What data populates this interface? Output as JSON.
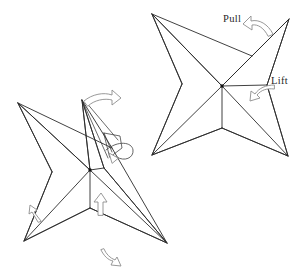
{
  "figure": {
    "type": "line-drawing",
    "background_color": "#ffffff",
    "line_color": "#2b2b2b",
    "arrow_outline_color": "#8d8d8d",
    "arrow_fill_color": "#ffffff",
    "text_color": "#1f1f1f"
  },
  "labels": {
    "pull": "Pull",
    "lift": "Lift"
  },
  "panels": [
    {
      "id": "right-star",
      "name": "four-point-star-before",
      "description": "Four pointed star / blintz base shown before the fold",
      "center_hub": [
        222,
        86
      ],
      "tips": [
        {
          "name": "top-left-tip",
          "x": 152,
          "y": 14
        },
        {
          "name": "top-right-tip",
          "x": 289,
          "y": 19
        },
        {
          "name": "bottom-left-tip",
          "x": 152,
          "y": 155
        },
        {
          "name": "bottom-right-tip",
          "x": 288,
          "y": 156
        }
      ],
      "inner_vertices": [
        {
          "name": "lower-inner-vertex",
          "x": 222,
          "y": 128
        },
        {
          "name": "right-inner-vertex",
          "x": 267,
          "y": 85
        }
      ]
    },
    {
      "id": "left-star",
      "name": "four-point-star-after",
      "description": "Same star after the flap has been pulled and lifted into a pinched point",
      "center_hub": [
        90,
        170
      ],
      "tips": [
        {
          "name": "left-tip",
          "x": 18,
          "y": 103
        },
        {
          "name": "top-pinch-tip",
          "x": 82,
          "y": 100
        },
        {
          "name": "bottom-left-tip",
          "x": 24,
          "y": 241
        },
        {
          "name": "bottom-right-tip",
          "x": 167,
          "y": 243
        }
      ],
      "inner_vertices": [
        {
          "name": "lower-inner-vertex",
          "x": 90,
          "y": 208
        },
        {
          "name": "right-inner-vertex",
          "x": 104,
          "y": 168
        }
      ]
    }
  ],
  "arrows": [
    {
      "name": "pull-arrow",
      "points_toward": "up-left",
      "near_label": "Pull",
      "x": 258,
      "y": 26
    },
    {
      "name": "lift-arrow",
      "points_toward": "left",
      "near_label": "Lift",
      "x": 257,
      "y": 92
    },
    {
      "name": "open-arrow-top-left-star",
      "points_toward": "right",
      "x": 97,
      "y": 97
    },
    {
      "name": "flap-hook-arrow",
      "points_toward": "curl-under",
      "x": 115,
      "y": 140
    },
    {
      "name": "lower-left-arrow",
      "points_toward": "up-left",
      "x": 33,
      "y": 213
    },
    {
      "name": "lower-center-arrow",
      "points_toward": "up",
      "x": 101,
      "y": 205
    },
    {
      "name": "bottom-arrow",
      "points_toward": "down",
      "x": 108,
      "y": 258
    }
  ]
}
